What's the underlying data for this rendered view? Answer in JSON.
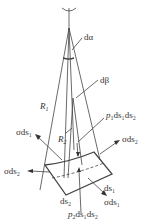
{
  "diagram": {
    "type": "membrane-element-force-diagram",
    "colors": {
      "stroke": "#444444",
      "text": "#333333",
      "background": "#ffffff"
    },
    "labels": {
      "d_alpha": "dα",
      "d_beta": "dβ",
      "R1": "R",
      "R1_sub": "1",
      "R2": "R",
      "R2_sub": "2",
      "p1": "p",
      "p1_sub": "1",
      "p1_rest": "ds₁ds₂",
      "p2": "p",
      "p2_sub": "2",
      "p2_rest": "ds₁ds₂",
      "sigma_ds1_left": "σds₁",
      "sigma_ds2_left": "σds₂",
      "sigma_ds2_right": "σds₂",
      "sigma_ds1_right": "σds₁",
      "ds1": "ds₁",
      "ds2": "ds₂"
    }
  }
}
